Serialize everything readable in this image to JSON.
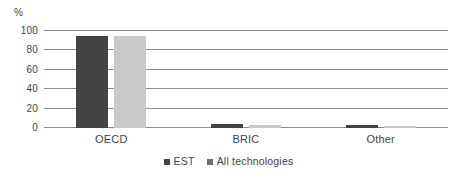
{
  "chart_data": {
    "type": "bar",
    "title": "",
    "subtitle": "",
    "xlabel": "",
    "ylabel": "%",
    "ylim": [
      0,
      100
    ],
    "yticks": [
      0,
      20,
      40,
      60,
      80,
      100
    ],
    "ytick_labels": [
      "0",
      "20",
      "40",
      "60",
      "80",
      "100"
    ],
    "grid": true,
    "legend_position": "bottom-center",
    "categories": [
      "OECD",
      "BRIC",
      "Other"
    ],
    "series": [
      {
        "name": "EST",
        "color": "#434343",
        "values": [
          95,
          4,
          3
        ]
      },
      {
        "name": "All technologies",
        "color": "#c9c9c9",
        "values": [
          95,
          3,
          2
        ]
      }
    ]
  },
  "axis": {
    "unit_label": "%"
  },
  "legend": {
    "entries": [
      {
        "label": "EST",
        "swatch": "legend-swatch-est"
      },
      {
        "label": "All technologies",
        "swatch": "legend-swatch-all"
      }
    ]
  }
}
